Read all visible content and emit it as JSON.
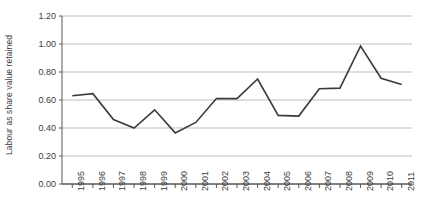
{
  "chart_data": {
    "type": "line",
    "title": "",
    "subtitle": "",
    "xlabel": "",
    "ylabel": "Labour as share value retained",
    "x": [
      1995,
      1996,
      1997,
      1998,
      1999,
      2000,
      2001,
      2002,
      2003,
      2004,
      2005,
      2006,
      2007,
      2008,
      2009,
      2010,
      2011
    ],
    "categories": [
      "1995",
      "1996",
      "1997",
      "1998",
      "1999",
      "2000",
      "2001",
      "2002",
      "2003",
      "2004",
      "2005",
      "2006",
      "2007",
      "2008",
      "2009",
      "2010",
      "2011"
    ],
    "values": [
      0.63,
      0.645,
      0.46,
      0.4,
      0.53,
      0.365,
      0.44,
      0.61,
      0.61,
      0.75,
      0.49,
      0.485,
      0.68,
      0.685,
      0.985,
      0.755,
      0.71
    ],
    "series": [
      {
        "name": "Labour as share value retained",
        "values": [
          0.63,
          0.645,
          0.46,
          0.4,
          0.53,
          0.365,
          0.44,
          0.61,
          0.61,
          0.75,
          0.49,
          0.485,
          0.68,
          0.685,
          0.985,
          0.755,
          0.71
        ],
        "color": "#3a3a3a"
      }
    ],
    "ylim": [
      0.0,
      1.2
    ],
    "ytick_values": [
      0.0,
      0.2,
      0.4,
      0.6,
      0.8,
      1.0,
      1.2
    ],
    "ytick_labels": [
      "0.00",
      "0.20",
      "0.40",
      "0.60",
      "0.80",
      "1.00",
      "1.20"
    ],
    "grid": "horizontal",
    "grid_color": "#bfbfbf",
    "axis_color": "#595959",
    "legend": "none",
    "legend_position": "none",
    "annotations": [],
    "background": "#ffffff"
  },
  "axes": {
    "y_title": "Labour as share value retained"
  }
}
